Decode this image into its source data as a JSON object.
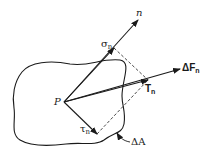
{
  "diagram": {
    "colors": {
      "line": "#1a1a1a",
      "background": "#ffffff"
    },
    "labels": {
      "normal": "n",
      "sigma": "σ",
      "sigma_sub": "n",
      "traction": "T",
      "traction_sub": "n",
      "force": "ΔF",
      "force_sub": "n",
      "point": "P",
      "tau": "τ",
      "tau_sub": "n",
      "area": "ΔA"
    },
    "points": {
      "P": [
        64,
        102
      ],
      "n_tip": [
        138,
        20
      ],
      "sigma_n": [
        114,
        48
      ],
      "T_n": [
        148,
        80
      ],
      "dF_tip": [
        180,
        69
      ],
      "tau_n": [
        97,
        134
      ]
    }
  }
}
